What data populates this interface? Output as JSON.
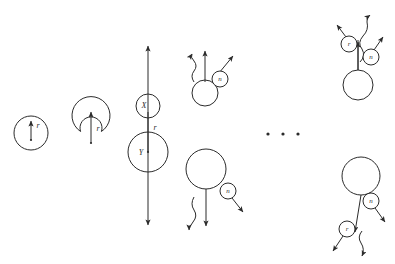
{
  "figure": {
    "type": "diagram",
    "title": "",
    "background_color": "#ffffff",
    "stroke_color": "#2b2b2b",
    "width": 395,
    "height": 264
  },
  "panels": [
    {
      "id": "panel-1",
      "name": "single-node-with-radius",
      "description": "Single large circle with a short upward arrow labelled r from its centre",
      "nodes": [
        {
          "id": "n1",
          "cx": 31,
          "cy": 133,
          "r": 17,
          "label": ""
        }
      ],
      "badges": [],
      "arrows": [
        {
          "id": "a1",
          "kind": "straight",
          "x1": 31,
          "y1": 140,
          "x2": 31,
          "y2": 121,
          "head": "end"
        }
      ],
      "labels": [
        {
          "id": "l1",
          "text": "r",
          "x": 38,
          "y": 126
        }
      ]
    },
    {
      "id": "panel-2",
      "name": "two-node-stack-with-radius",
      "description": "Small circle budding on top of a large circle, arrow labelled r",
      "nodes": [
        {
          "id": "n2a",
          "cx": 91,
          "cy": 117,
          "r": 11,
          "label": ""
        },
        {
          "id": "n2b",
          "cx": 91,
          "cy": 140,
          "r": 19,
          "label": ""
        }
      ],
      "badges": [],
      "arrows": [
        {
          "id": "a2",
          "kind": "straight",
          "x1": 91,
          "y1": 143,
          "x2": 91,
          "y2": 112,
          "head": "end"
        }
      ],
      "labels": [
        {
          "id": "l2",
          "text": "r",
          "x": 98,
          "y": 129
        }
      ]
    },
    {
      "id": "panel-3",
      "name": "xy-node-pair-double-arrow",
      "description": "Small circle X above large circle Y, long double-headed vertical arrow through both, labelled r",
      "nodes": [
        {
          "id": "n3x",
          "cx": 148,
          "cy": 106,
          "r": 12,
          "label": "X"
        },
        {
          "id": "n3y",
          "cx": 148,
          "cy": 152,
          "r": 20,
          "label": "Y"
        }
      ],
      "badges": [],
      "arrows": [
        {
          "id": "a3",
          "kind": "straight",
          "x1": 148,
          "y1": 225,
          "x2": 148,
          "y2": 46,
          "head": "both"
        }
      ],
      "labels": [
        {
          "id": "l3",
          "text": "r",
          "x": 155,
          "y": 128
        }
      ]
    },
    {
      "id": "panel-4-top",
      "name": "emission-node-upper",
      "description": "Circle emitting a straight arrow and a wavy arrow upward, with badge n on a diagonal arrow",
      "nodes": [
        {
          "id": "n4t",
          "cx": 205,
          "cy": 93,
          "r": 13,
          "label": ""
        }
      ],
      "badges": [
        {
          "id": "b4t",
          "cx": 220,
          "cy": 79,
          "r": 8,
          "label": "n"
        }
      ],
      "arrows": [
        {
          "id": "a4t1",
          "kind": "straight",
          "x1": 205,
          "y1": 82,
          "x2": 205,
          "y2": 51,
          "head": "end"
        },
        {
          "id": "a4t2",
          "kind": "diagonal",
          "x1": 219,
          "y1": 73,
          "x2": 233,
          "y2": 56,
          "head": "end"
        }
      ],
      "waves": [
        {
          "id": "w4t",
          "x1": 194,
          "y1": 82,
          "x2": 192,
          "y2": 53,
          "head": "end"
        }
      ],
      "labels": []
    },
    {
      "id": "panel-4-bottom",
      "name": "emission-node-lower",
      "description": "Large circle emitting a straight arrow and a wavy arrow downward, with badge n on a diagonal arrow",
      "nodes": [
        {
          "id": "n4b",
          "cx": 206,
          "cy": 169,
          "r": 20,
          "label": ""
        }
      ],
      "badges": [
        {
          "id": "b4b",
          "cx": 228,
          "cy": 191,
          "r": 8,
          "label": "n"
        }
      ],
      "arrows": [
        {
          "id": "a4b1",
          "kind": "straight",
          "x1": 206,
          "y1": 189,
          "x2": 206,
          "y2": 226,
          "head": "end"
        },
        {
          "id": "a4b2",
          "kind": "diagonal",
          "x1": 232,
          "y1": 198,
          "x2": 243,
          "y2": 212,
          "head": "end"
        }
      ],
      "waves": [
        {
          "id": "w4b",
          "x1": 194,
          "y1": 197,
          "x2": 188,
          "y2": 230,
          "head": "end"
        }
      ],
      "labels": []
    },
    {
      "id": "panel-5-top",
      "name": "branching-node-upper",
      "description": "Circle on a stem emitting a straight arrow and a wavy arrow, badges r and n on diagonal arrows",
      "nodes": [
        {
          "id": "n5t",
          "cx": 358,
          "cy": 85,
          "r": 15,
          "label": ""
        }
      ],
      "badges": [
        {
          "id": "b5t1",
          "cx": 349,
          "cy": 44,
          "r": 8,
          "label": "r"
        },
        {
          "id": "b5t2",
          "cx": 371,
          "cy": 57,
          "r": 8,
          "label": "n"
        }
      ],
      "arrows": [
        {
          "id": "a5t1",
          "kind": "straight",
          "x1": 358,
          "y1": 70,
          "x2": 358,
          "y2": 40,
          "head": "none"
        },
        {
          "id": "a5t2",
          "kind": "diagonal",
          "x1": 346,
          "y1": 37,
          "x2": 337,
          "y2": 25,
          "head": "end"
        },
        {
          "id": "a5t3",
          "kind": "diagonal",
          "x1": 374,
          "y1": 50,
          "x2": 383,
          "y2": 37,
          "head": "end"
        }
      ],
      "waves": [
        {
          "id": "w5t",
          "x1": 362,
          "y1": 62,
          "x2": 372,
          "y2": 14,
          "head": "end"
        }
      ],
      "labels": []
    },
    {
      "id": "panel-5-bottom",
      "name": "branching-node-lower",
      "description": "Large circle on a stem emitting a straight arrow and a wavy arrow downward, badges r and n on diagonal arrows",
      "nodes": [
        {
          "id": "n5b",
          "cx": 361,
          "cy": 176,
          "r": 19,
          "label": ""
        }
      ],
      "badges": [
        {
          "id": "b5b1",
          "cx": 347,
          "cy": 229,
          "r": 8,
          "label": "r"
        },
        {
          "id": "b5b2",
          "cx": 371,
          "cy": 201,
          "r": 8,
          "label": "n"
        }
      ],
      "arrows": [
        {
          "id": "a5b1",
          "kind": "straight",
          "x1": 361,
          "y1": 195,
          "x2": 355,
          "y2": 232,
          "head": "end"
        },
        {
          "id": "a5b2",
          "kind": "diagonal",
          "x1": 343,
          "y1": 236,
          "x2": 333,
          "y2": 251,
          "head": "end"
        },
        {
          "id": "a5b3",
          "kind": "diagonal",
          "x1": 375,
          "y1": 208,
          "x2": 385,
          "y2": 222,
          "head": "end"
        }
      ],
      "waves": [
        {
          "id": "w5b",
          "x1": 362,
          "y1": 231,
          "x2": 366,
          "y2": 256,
          "head": "end"
        }
      ],
      "labels": []
    }
  ],
  "ellipsis": {
    "name": "continuation-ellipsis",
    "dots": [
      {
        "cx": 268,
        "cy": 134,
        "r": 1.6
      },
      {
        "cx": 283,
        "cy": 134,
        "r": 1.6
      },
      {
        "cx": 298,
        "cy": 134,
        "r": 1.6
      }
    ]
  }
}
